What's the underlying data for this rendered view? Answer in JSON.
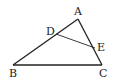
{
  "diagram": {
    "type": "triangle",
    "stroke_color": "#222222",
    "points": {
      "A": {
        "label": "A",
        "x": 78,
        "y": 19
      },
      "B": {
        "label": "B",
        "x": 13,
        "y": 65
      },
      "C": {
        "label": "C",
        "x": 102,
        "y": 65
      },
      "D": {
        "label": "D",
        "x": 56,
        "y": 34
      },
      "E": {
        "label": "E",
        "x": 95,
        "y": 48
      }
    },
    "segments": [
      [
        "A",
        "B"
      ],
      [
        "B",
        "C"
      ],
      [
        "C",
        "A"
      ],
      [
        "D",
        "E"
      ]
    ]
  }
}
